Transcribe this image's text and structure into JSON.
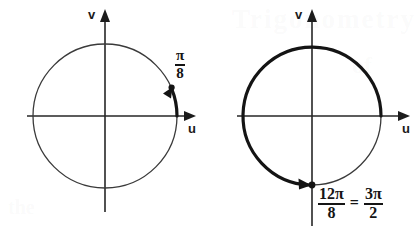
{
  "figure": {
    "background_color": "#ffffff",
    "ink_color": "#151515"
  },
  "diagrams": [
    {
      "id": "left",
      "name": "pi-over-eight-circle",
      "center": {
        "x": 105,
        "y": 116
      },
      "radius": 72,
      "circle_stroke": "thin",
      "axes": {
        "horizontal_label": "u",
        "vertical_label": "v"
      },
      "arc": {
        "start_angle_deg": 0,
        "end_angle_deg": 22.5,
        "direction": "counterclockwise",
        "stroke": "thick",
        "has_arrowhead": true,
        "has_endpoint_dot": true
      },
      "angle_label": {
        "numerator": "π",
        "denominator": "8",
        "text": "π/8"
      }
    },
    {
      "id": "right",
      "name": "twelve-pi-over-eight-circle",
      "center": {
        "x": 312,
        "y": 116
      },
      "radius": 69,
      "circle_stroke": "thin",
      "axes": {
        "horizontal_label": "u",
        "vertical_label": "v"
      },
      "arc": {
        "start_angle_deg": 0,
        "end_angle_deg": 270,
        "direction": "counterclockwise",
        "stroke": "thick",
        "has_arrowhead": true,
        "has_endpoint_dot": true
      },
      "angle_label": {
        "left_fraction": {
          "numerator": "12π",
          "denominator": "8"
        },
        "equals": "=",
        "right_fraction": {
          "numerator": "3π",
          "denominator": "2"
        },
        "text": "12π/8 = 3π/2"
      }
    }
  ],
  "ghost_text": {
    "top": "Trigonometry",
    "middle": "of",
    "bottom": "the"
  }
}
